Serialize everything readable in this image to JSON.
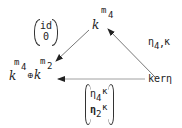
{
  "diagram": {
    "type": "commutative-triangle",
    "nodes": {
      "top": {
        "base": "k",
        "exp_base": "m",
        "exp_sub": "4"
      },
      "left": {
        "base1": "k",
        "exp1_base": "m",
        "exp1_sub": "4",
        "op": "⊕",
        "base2": "k",
        "exp2_base": "m",
        "exp2_sub": "2"
      },
      "right": {
        "text": "kerη"
      }
    },
    "arrows": {
      "top_to_left": {
        "row1": "id",
        "row2": "0"
      },
      "right_to_top": {
        "eta": "η",
        "eta_sub": "4",
        "sep": ",",
        "kappa": "κ"
      },
      "right_to_left": {
        "row1": {
          "eta": "η",
          "sub": "4",
          "kappa": "κ"
        },
        "row2": {
          "eta": "η",
          "sub": "2",
          "kappa": "κ"
        }
      }
    }
  }
}
